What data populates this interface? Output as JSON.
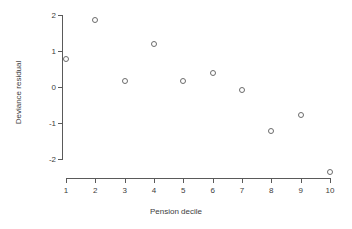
{
  "chart_data": {
    "type": "scatter",
    "title": "",
    "xlabel": "Pension decile",
    "ylabel": "Deviance residual",
    "x": [
      1,
      2,
      3,
      4,
      5,
      6,
      7,
      8,
      9,
      10
    ],
    "values": [
      0.78,
      1.86,
      0.17,
      1.19,
      0.17,
      0.39,
      -0.08,
      -1.23,
      -0.79,
      -2.37
    ],
    "series": [
      {
        "name": "Deviance residual",
        "values": [
          0.78,
          1.86,
          0.17,
          1.19,
          0.17,
          0.39,
          -0.08,
          -1.23,
          -0.79,
          -2.37
        ]
      }
    ],
    "xtick_labels": [
      "1",
      "2",
      "3",
      "4",
      "5",
      "6",
      "7",
      "8",
      "9",
      "10"
    ],
    "ytick_labels": [
      "2",
      "1",
      "0",
      "-1",
      "-2"
    ],
    "ytick_values": [
      2,
      1,
      0,
      -1,
      -2
    ],
    "xlim": [
      0.6,
      10.4
    ],
    "ylim": [
      -2.55,
      2.1
    ],
    "grid": false,
    "legend": false,
    "legend_position": "none",
    "marker": "open-circle",
    "marker_color": "#6b6b6b",
    "axis_color": "#5a5a5a",
    "background_color": "#ffffff"
  },
  "axis_titles": {
    "x": "Pension decile",
    "y": "Deviance residual"
  }
}
